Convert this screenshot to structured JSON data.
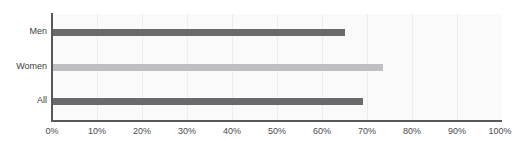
{
  "chart_data": {
    "type": "bar",
    "orientation": "horizontal",
    "title": "",
    "xlabel": "",
    "ylabel": "",
    "categories": [
      "Men",
      "Women",
      "All"
    ],
    "values": [
      65,
      73.5,
      69
    ],
    "value_suffix": "%",
    "xlim": [
      0,
      100
    ],
    "xticks": [
      0,
      10,
      20,
      30,
      40,
      50,
      60,
      70,
      80,
      90,
      100
    ],
    "xtick_labels": [
      "0%",
      "10%",
      "20%",
      "30%",
      "40%",
      "50%",
      "60%",
      "70%",
      "80%",
      "90%",
      "100%"
    ],
    "grid": true,
    "grid_axis": "x",
    "legend": "none",
    "series": [
      {
        "name": "Men",
        "value": 65,
        "color": "#6a6a6c"
      },
      {
        "name": "Women",
        "value": 73.5,
        "color": "#bfbfc1"
      },
      {
        "name": "All",
        "value": 69,
        "color": "#6a6a6c"
      }
    ]
  },
  "colors": {
    "bar_dark": "#6a6a6c",
    "bar_light": "#bfbfc1",
    "plot_background": "#fafafa",
    "page_background": "#ffffff",
    "axis_line": "#58585a",
    "gridline": "#ededed",
    "label_text": "#3d3d3f",
    "tick_text": "#4a4a4c"
  }
}
